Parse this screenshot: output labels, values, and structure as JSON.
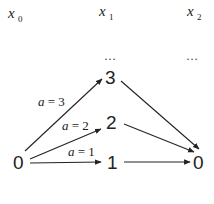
{
  "stages": [
    {
      "var": "x",
      "sub": "0"
    },
    {
      "var": "x",
      "sub": "1"
    },
    {
      "var": "x",
      "sub": "2"
    }
  ],
  "ellipsis": [
    "…",
    "…"
  ],
  "nodes": {
    "start": "0",
    "mid_top": "3",
    "mid_middle": "2",
    "mid_bottom": "1",
    "end": "0"
  },
  "edge_labels": [
    {
      "var": "a",
      "eq": " = 3"
    },
    {
      "var": "a",
      "eq": " = 2"
    },
    {
      "var": "a",
      "eq": " = 1"
    }
  ],
  "colors": {
    "line": "#222222",
    "background": "#ffffff"
  }
}
